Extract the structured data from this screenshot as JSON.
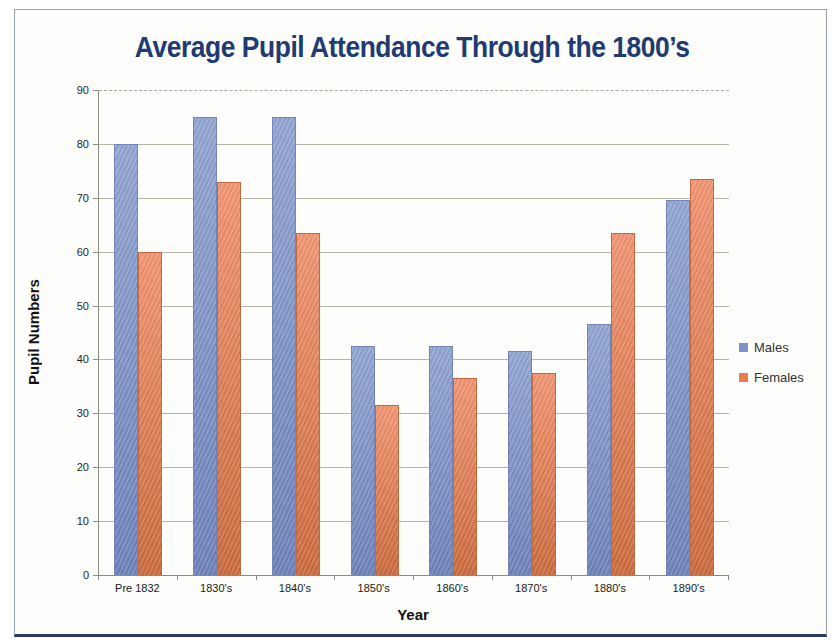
{
  "chart_data": {
    "type": "bar",
    "title": "Average Pupil Attendance Through the 1800’s",
    "xlabel": "Year",
    "ylabel": "Pupil Numbers",
    "ylim": [
      0,
      90
    ],
    "ytick_step": 10,
    "grid": true,
    "legend_position": "right",
    "categories": [
      "Pre 1832",
      "1830's",
      "1840's",
      "1850's",
      "1860's",
      "1870's",
      "1880's",
      "1890's"
    ],
    "series": [
      {
        "name": "Males",
        "values": [
          80,
          85,
          85,
          42.5,
          42.5,
          41.5,
          46.5,
          69.5
        ],
        "color_top": "#92a5d3",
        "color_bottom": "#6c82ba",
        "border_color": "#7484b4",
        "legend_color": "#7d93c5"
      },
      {
        "name": "Females",
        "values": [
          60,
          73,
          63.5,
          31.5,
          36.5,
          37.5,
          63.5,
          73.5
        ],
        "color_top": "#f19572",
        "color_bottom": "#cc6a3d",
        "border_color": "#c06a44",
        "legend_color": "#e57e4f"
      }
    ]
  },
  "colors": {
    "title_text": "#203a72",
    "frame_border": "#99a1af",
    "frame_bottom_edge": "#2e3c60",
    "axis_line": "#8a8a7e",
    "gridline": "#b6b6a8",
    "plot_background": "#fdfdfb"
  }
}
